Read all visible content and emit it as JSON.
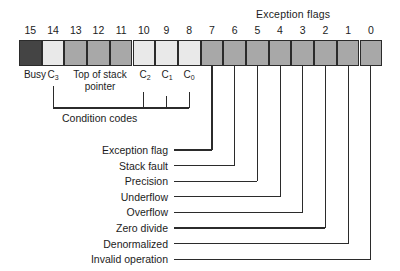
{
  "diagram": {
    "group_headings": {
      "exception_flags": "Exception flags",
      "condition_codes": "Condition codes"
    },
    "bit_numbers": [
      "15",
      "14",
      "13",
      "12",
      "11",
      "10",
      "9",
      "8",
      "7",
      "6",
      "5",
      "4",
      "3",
      "2",
      "1",
      "0"
    ],
    "cells": [
      {
        "bit": "15",
        "shade": "dark"
      },
      {
        "bit": "14",
        "shade": "light"
      },
      {
        "bit": "13",
        "shade": "mid"
      },
      {
        "bit": "12",
        "shade": "mid"
      },
      {
        "bit": "11",
        "shade": "mid"
      },
      {
        "bit": "10",
        "shade": "light"
      },
      {
        "bit": "9",
        "shade": "light"
      },
      {
        "bit": "8",
        "shade": "light"
      },
      {
        "bit": "7",
        "shade": "mid"
      },
      {
        "bit": "6",
        "shade": "mid"
      },
      {
        "bit": "5",
        "shade": "mid"
      },
      {
        "bit": "4",
        "shade": "mid"
      },
      {
        "bit": "3",
        "shade": "mid"
      },
      {
        "bit": "2",
        "shade": "mid"
      },
      {
        "bit": "1",
        "shade": "mid"
      },
      {
        "bit": "0",
        "shade": "mid"
      }
    ],
    "field_labels": [
      {
        "name": "busy",
        "text": "Busy"
      },
      {
        "name": "c3",
        "text": "C",
        "sub": "3"
      },
      {
        "name": "top-of-stack",
        "text": "Top of stack pointer"
      },
      {
        "name": "c2",
        "text": "C",
        "sub": "2"
      },
      {
        "name": "c1",
        "text": "C",
        "sub": "1"
      },
      {
        "name": "c0",
        "text": "C",
        "sub": "0"
      }
    ],
    "callouts": [
      {
        "bit": "7",
        "label": "Exception flag"
      },
      {
        "bit": "6",
        "label": "Stack fault"
      },
      {
        "bit": "5",
        "label": "Precision"
      },
      {
        "bit": "4",
        "label": "Underflow"
      },
      {
        "bit": "3",
        "label": "Overflow"
      },
      {
        "bit": "2",
        "label": "Zero divide"
      },
      {
        "bit": "1",
        "label": "Denormalized"
      },
      {
        "bit": "0",
        "label": "Invalid operation"
      }
    ],
    "colors": {
      "ink": "#1c1c1c",
      "stroke": "#2b2b2b",
      "shade_dark": "#444444",
      "shade_mid": "#a8a8a8",
      "shade_light": "#e9e9e9",
      "background": "#ffffff"
    }
  }
}
